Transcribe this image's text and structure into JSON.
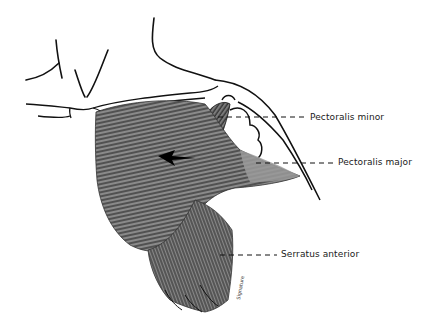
{
  "figure": {
    "labels": [
      {
        "id": "pectoralis-minor",
        "text": "Pectoralis minor"
      },
      {
        "id": "pectoralis-major",
        "text": "Pectoralis major"
      },
      {
        "id": "serratus-anterior",
        "text": "Serratus anterior"
      }
    ],
    "signature": "artist signature (illegible)",
    "colors": {
      "line": "#111111",
      "muscle_fill": "#6e6e6e",
      "muscle_light": "#9a9a9a",
      "background": "#ffffff"
    }
  }
}
